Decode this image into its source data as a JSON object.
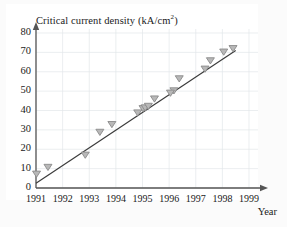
{
  "chart_data": {
    "type": "scatter",
    "title": "Critical current density (kA/cm2)",
    "title_main": "Critical current density (kA/cm",
    "title_sup": "2",
    "title_tail": ")",
    "xlabel": "Year",
    "ylabel": "",
    "xlim": [
      1991,
      1999
    ],
    "ylim": [
      0,
      80
    ],
    "xticks": [
      "1991",
      "1992",
      "1993",
      "1994",
      "1995",
      "1996",
      "1997",
      "1998",
      "1999"
    ],
    "yticks": [
      "0",
      "10",
      "20",
      "30",
      "40",
      "50",
      "60",
      "70",
      "80"
    ],
    "grid": true,
    "legend": "none",
    "marker": "open-down-triangle",
    "marker_color": "#8a8a8a",
    "line_color": "#3a3a3a",
    "axis_color": "#555555",
    "grid_color": "#e3e6ea",
    "points": [
      {
        "x": 1991.02,
        "y": 6.0
      },
      {
        "x": 1991.45,
        "y": 9.5
      },
      {
        "x": 1992.85,
        "y": 15.8
      },
      {
        "x": 1993.4,
        "y": 27.6
      },
      {
        "x": 1993.85,
        "y": 31.6
      },
      {
        "x": 1994.82,
        "y": 37.6
      },
      {
        "x": 1995.02,
        "y": 39.8
      },
      {
        "x": 1995.1,
        "y": 40.2
      },
      {
        "x": 1995.45,
        "y": 44.8
      },
      {
        "x": 1996.18,
        "y": 49.0
      },
      {
        "x": 1996.38,
        "y": 55.2
      },
      {
        "x": 1997.35,
        "y": 60.2
      },
      {
        "x": 1997.55,
        "y": 64.5
      },
      {
        "x": 1998.05,
        "y": 69.0
      },
      {
        "x": 1998.4,
        "y": 70.8
      },
      {
        "x": 1995.22,
        "y": 41.0
      },
      {
        "x": 1996.05,
        "y": 47.8
      }
    ],
    "trend_line": {
      "x0": 1991.0,
      "y0": 2.5,
      "x1": 1998.5,
      "y1": 71.0
    }
  }
}
